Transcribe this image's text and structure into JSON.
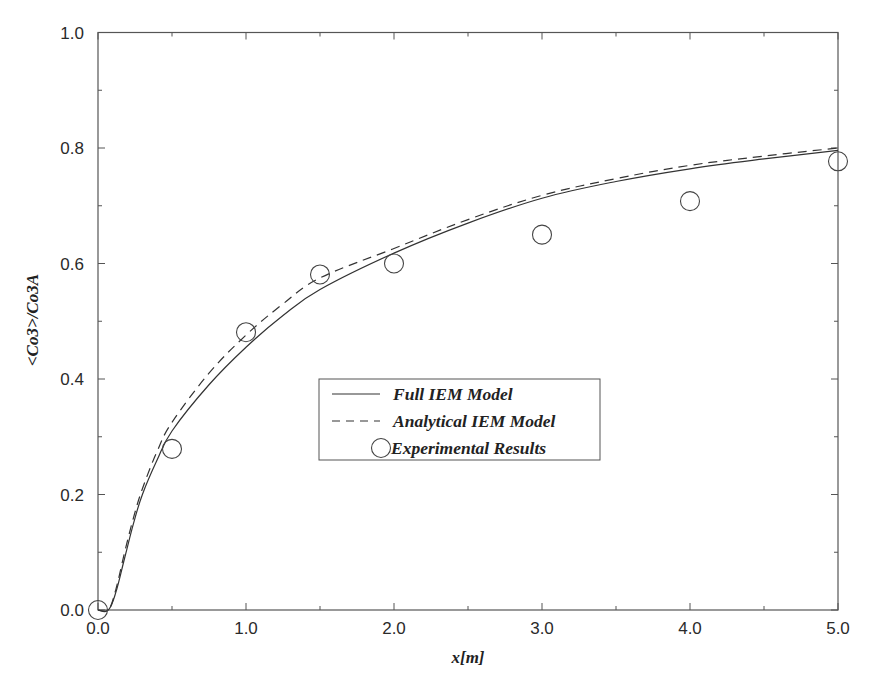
{
  "chart_data": {
    "type": "line",
    "title": "",
    "xlabel": "x[m]",
    "ylabel": "<Co3>/Co3A",
    "xlim": [
      0,
      5
    ],
    "ylim": [
      0,
      1
    ],
    "grid": false,
    "legend_position": "center (inside plot, around x=1.5-3.4, y=0.26-0.40)",
    "x_ticks": [
      0.0,
      1.0,
      2.0,
      3.0,
      4.0,
      5.0
    ],
    "x_tick_labels": [
      "0.0",
      "1.0",
      "2.0",
      "3.0",
      "4.0",
      "5.0"
    ],
    "x_minor_ticks": [
      0.5,
      1.5,
      2.5,
      3.5,
      4.5
    ],
    "y_ticks": [
      0.0,
      0.2,
      0.4,
      0.6,
      0.8,
      1.0
    ],
    "y_tick_labels": [
      "0.0",
      "0.2",
      "0.4",
      "0.6",
      "0.8",
      "1.0"
    ],
    "y_minor_ticks": [
      0.1,
      0.3,
      0.5,
      0.7,
      0.9
    ],
    "series": [
      {
        "name": "Full IEM Model",
        "style": "solid line",
        "x": [
          0.0,
          0.07,
          0.12,
          0.18,
          0.24,
          0.3,
          0.4,
          0.5,
          0.75,
          1.0,
          1.25,
          1.5,
          2.0,
          2.5,
          3.0,
          3.5,
          4.0,
          4.5,
          5.0
        ],
        "values": [
          0.0,
          0.0,
          0.03,
          0.09,
          0.15,
          0.2,
          0.26,
          0.31,
          0.39,
          0.455,
          0.51,
          0.555,
          0.618,
          0.67,
          0.713,
          0.742,
          0.764,
          0.781,
          0.796
        ]
      },
      {
        "name": "Analytical IEM Model",
        "style": "dashed line",
        "x": [
          0.0,
          0.07,
          0.12,
          0.18,
          0.24,
          0.3,
          0.4,
          0.5,
          0.75,
          1.0,
          1.25,
          1.5,
          2.0,
          2.5,
          3.0,
          3.5,
          4.0,
          4.5,
          5.0
        ],
        "values": [
          0.0,
          0.0,
          0.035,
          0.1,
          0.16,
          0.21,
          0.275,
          0.325,
          0.41,
          0.476,
          0.53,
          0.575,
          0.626,
          0.676,
          0.718,
          0.747,
          0.77,
          0.786,
          0.8
        ]
      },
      {
        "name": "Experimental Results",
        "style": "open circle markers",
        "x": [
          0.0,
          0.5,
          1.0,
          1.5,
          2.0,
          3.0,
          4.0,
          5.0
        ],
        "values": [
          0.0,
          0.279,
          0.481,
          0.581,
          0.6,
          0.65,
          0.708,
          0.777
        ]
      }
    ]
  },
  "legend": {
    "items": [
      {
        "label": "Full IEM Model"
      },
      {
        "label": "Analytical IEM Model"
      },
      {
        "label": "Experimental Results"
      }
    ]
  },
  "axes": {
    "x_title": "x[m]",
    "y_title": "<Co3>/Co3A"
  },
  "colors": {
    "ink": "#2a2a2a",
    "frame": "#555555",
    "background": "#ffffff"
  }
}
